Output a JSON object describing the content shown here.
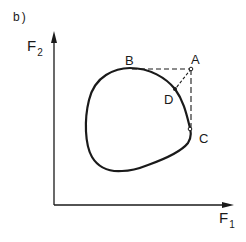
{
  "figure": {
    "panel_label": "b)",
    "axes": {
      "y_label": "F",
      "y_label_sub": "2",
      "x_label": "F",
      "x_label_sub": "1"
    },
    "points": [
      {
        "id": "A",
        "label": "A"
      },
      {
        "id": "B",
        "label": "B"
      },
      {
        "id": "C",
        "label": "C"
      },
      {
        "id": "D",
        "label": "D"
      }
    ],
    "colors": {
      "ink": "#1a1a1a",
      "background": "#ffffff"
    }
  }
}
